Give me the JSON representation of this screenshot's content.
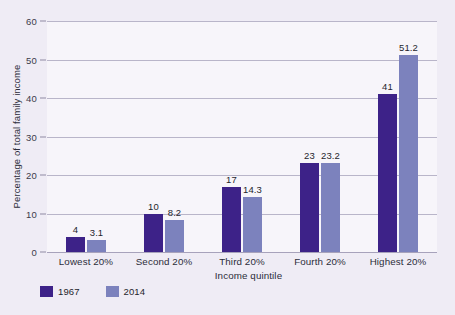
{
  "chart_data": {
    "type": "bar",
    "title": "",
    "xlabel": "Income quintile",
    "ylabel": "Percentage of total family income",
    "categories": [
      "Lowest 20%",
      "Second 20%",
      "Third 20%",
      "Fourth 20%",
      "Highest 20%"
    ],
    "series": [
      {
        "name": "1967",
        "color": "#3d2288",
        "values": [
          4,
          10,
          17,
          23,
          41
        ],
        "labels": [
          "4",
          "10",
          "17",
          "23",
          "41"
        ]
      },
      {
        "name": "2014",
        "color": "#7c82bd",
        "values": [
          3.1,
          8.2,
          14.3,
          23.2,
          51.2
        ],
        "labels": [
          "3.1",
          "8.2",
          "14.3",
          "23.2",
          "51.2"
        ]
      }
    ],
    "ylim": [
      0,
      60
    ],
    "yticks": [
      0,
      10,
      20,
      30,
      40,
      50,
      60
    ],
    "ytick_labels": [
      "0",
      "10",
      "20",
      "30",
      "40",
      "50",
      "60"
    ],
    "grid": "horizontal",
    "legend_position": "bottom-left"
  },
  "colors": {
    "background": "#efecf5",
    "plot_background": "#f7f5fa",
    "gridline": "#b9b5c9",
    "series_1967": "#3d2288",
    "series_2014": "#7c82bd",
    "text": "#2c2c3a"
  }
}
